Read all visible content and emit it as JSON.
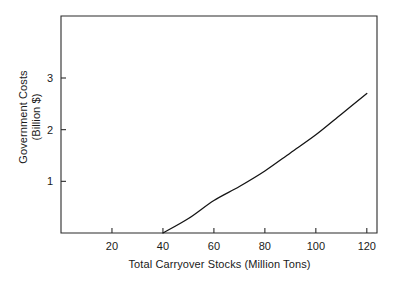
{
  "chart_data": {
    "type": "line",
    "title": "",
    "subtitle": "",
    "xlabel": "Total Carryover Stocks (Million Tons)",
    "ylabel_line1": "Government Costs",
    "ylabel_line2": "(Billion $)",
    "ylabel": "Government Costs (Billion $)",
    "xlim": [
      0,
      124
    ],
    "ylim": [
      0,
      4.2
    ],
    "xticks": [
      20,
      40,
      60,
      80,
      100,
      120
    ],
    "xtick_labels": [
      "20",
      "40",
      "60",
      "80",
      "100",
      "120"
    ],
    "yticks": [
      1,
      2,
      3
    ],
    "ytick_labels": [
      "1",
      "2",
      "3"
    ],
    "grid": false,
    "legend": "none",
    "series": [
      {
        "name": "Government Costs",
        "x": [
          40,
          50,
          60,
          70,
          80,
          90,
          100,
          110,
          120
        ],
        "values": [
          0,
          0.28,
          0.63,
          0.9,
          1.2,
          1.55,
          1.9,
          2.3,
          2.7
        ]
      }
    ],
    "line_color": "#141414",
    "axis_color": "#2b2b2b",
    "background_color": "#ffffff"
  }
}
